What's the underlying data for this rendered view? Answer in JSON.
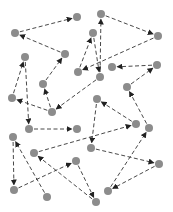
{
  "diagram": {
    "type": "directed-graph",
    "node_color": "#8c8c8c",
    "edge_color": "#333333",
    "node_radius": 4,
    "nodes": [
      {
        "id": "A",
        "x": 15,
        "y": 33
      },
      {
        "id": "B",
        "x": 77,
        "y": 17
      },
      {
        "id": "C",
        "x": 101,
        "y": 14
      },
      {
        "id": "D",
        "x": 158,
        "y": 36
      },
      {
        "id": "P",
        "x": 93,
        "y": 33
      },
      {
        "id": "E",
        "x": 65,
        "y": 54
      },
      {
        "id": "F",
        "x": 25,
        "y": 57
      },
      {
        "id": "H",
        "x": 78,
        "y": 72
      },
      {
        "id": "Q",
        "x": 100,
        "y": 77
      },
      {
        "id": "R",
        "x": 112,
        "y": 67
      },
      {
        "id": "S",
        "x": 157,
        "y": 65
      },
      {
        "id": "T",
        "x": 127,
        "y": 87
      },
      {
        "id": "G",
        "x": 43,
        "y": 84
      },
      {
        "id": "F2",
        "x": 12,
        "y": 98
      },
      {
        "id": "V",
        "x": 97,
        "y": 99
      },
      {
        "id": "U",
        "x": 52,
        "y": 112
      },
      {
        "id": "W",
        "x": 77,
        "y": 129
      },
      {
        "id": "X",
        "x": 29,
        "y": 129
      },
      {
        "id": "Y",
        "x": 136,
        "y": 124
      },
      {
        "id": "Z",
        "x": 149,
        "y": 128
      },
      {
        "id": "AB",
        "x": 13,
        "y": 137
      },
      {
        "id": "AA",
        "x": 91,
        "y": 148
      },
      {
        "id": "AC",
        "x": 34,
        "y": 153
      },
      {
        "id": "AD",
        "x": 76,
        "y": 161
      },
      {
        "id": "AG",
        "x": 159,
        "y": 164
      },
      {
        "id": "AE",
        "x": 14,
        "y": 190
      },
      {
        "id": "AH",
        "x": 108,
        "y": 191
      },
      {
        "id": "AF",
        "x": 47,
        "y": 197
      },
      {
        "id": "AI",
        "x": 96,
        "y": 202
      }
    ],
    "edges": [
      {
        "from": "A",
        "to": "B"
      },
      {
        "from": "E",
        "to": "A"
      },
      {
        "from": "C",
        "to": "D"
      },
      {
        "from": "Q",
        "to": "C"
      },
      {
        "from": "P",
        "to": "Q"
      },
      {
        "from": "H",
        "to": "P"
      },
      {
        "from": "D",
        "to": "H"
      },
      {
        "from": "G",
        "to": "E"
      },
      {
        "from": "F2",
        "to": "F"
      },
      {
        "from": "U",
        "to": "G"
      },
      {
        "from": "U",
        "to": "F2"
      },
      {
        "from": "Q",
        "to": "U"
      },
      {
        "from": "S",
        "to": "R"
      },
      {
        "from": "T",
        "to": "S"
      },
      {
        "from": "Z",
        "to": "T"
      },
      {
        "from": "Y",
        "to": "V"
      },
      {
        "from": "F",
        "to": "X"
      },
      {
        "from": "X",
        "to": "W"
      },
      {
        "from": "V",
        "to": "AA"
      },
      {
        "from": "AC",
        "to": "Y"
      },
      {
        "from": "AB",
        "to": "AE"
      },
      {
        "from": "AF",
        "to": "AB"
      },
      {
        "from": "AE",
        "to": "AD"
      },
      {
        "from": "AI",
        "to": "AC"
      },
      {
        "from": "AA",
        "to": "AG"
      },
      {
        "from": "AG",
        "to": "AH"
      },
      {
        "from": "AH",
        "to": "Z"
      },
      {
        "from": "AD",
        "to": "AI"
      }
    ]
  }
}
